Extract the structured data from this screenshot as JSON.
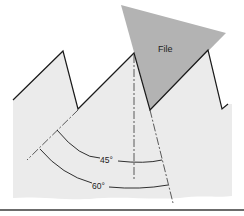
{
  "diagram": {
    "labels": {
      "file": "File",
      "angle_small": "45°",
      "angle_large": "60°"
    },
    "colors": {
      "background": "#ffffff",
      "tooth_fill": "#ebebeb",
      "file_fill": "#b3b3b3",
      "line": "#1a1a1a",
      "rule": "#3a3a3a"
    }
  }
}
